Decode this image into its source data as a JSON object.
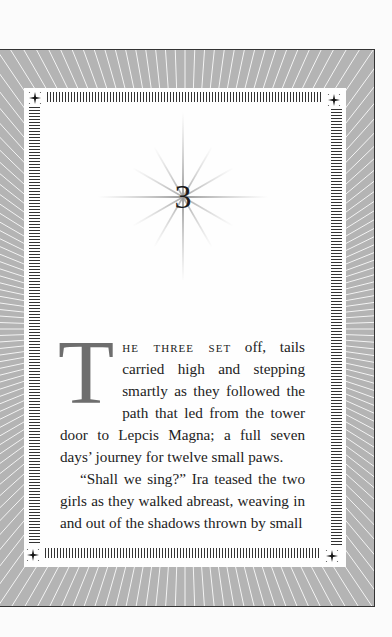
{
  "page": {
    "chapter_number": "3",
    "drop_cap": "T",
    "lead_in": "he three set",
    "paragraphs": [
      " off, tails carried high and stepping smartly as they followed the path that led from the tower door to Lepcis Magna; a full seven days’ journey for twelve small paws.",
      "“Shall we sing?” Ira teased the two girls as they walked abreast, weaving in and out of the shadows thrown by small"
    ]
  },
  "decor": {
    "frame_color": "#b4b4b4",
    "ray_color": "#ffffff",
    "panel_color": "#fefefe",
    "drop_cap_color": "#6e6e6e",
    "icons": [
      "starburst-icon",
      "corner-star-icon"
    ]
  }
}
